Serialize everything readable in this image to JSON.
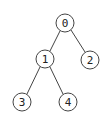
{
  "diagram": {
    "type": "binary-tree",
    "nodes": [
      {
        "id": "0",
        "label": "0",
        "x": 65,
        "y": 23
      },
      {
        "id": "1",
        "label": "1",
        "x": 45,
        "y": 59
      },
      {
        "id": "2",
        "label": "2",
        "x": 90,
        "y": 60
      },
      {
        "id": "3",
        "label": "3",
        "x": 22,
        "y": 102
      },
      {
        "id": "4",
        "label": "4",
        "x": 68,
        "y": 102
      }
    ],
    "edges": [
      {
        "from": "0",
        "to": "1"
      },
      {
        "from": "0",
        "to": "2"
      },
      {
        "from": "1",
        "to": "3"
      },
      {
        "from": "1",
        "to": "4"
      }
    ],
    "colors": {
      "stroke": "#444444",
      "fill": "#ffffff",
      "text": "#222222"
    }
  }
}
